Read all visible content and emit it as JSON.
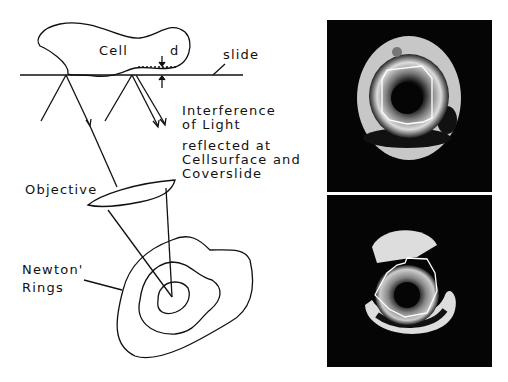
{
  "diagram": {
    "labels": {
      "cell": "Cell",
      "d": "d",
      "slide": "slide",
      "interference_1": "Interference",
      "interference_2": "of Light",
      "interference_3": "reflected at",
      "interference_4": "Cellsurface and",
      "interference_5": "Coverslide",
      "objective": "Objective",
      "newton_1": "Newton'",
      "newton_2": "Rings"
    }
  },
  "micrographs": {
    "top": "interference-reflection-image-1",
    "bottom": "interference-reflection-image-2"
  },
  "colors": {
    "ink": "#111111",
    "panel_bg": "#050505",
    "fringe": "#e8e8e8"
  }
}
